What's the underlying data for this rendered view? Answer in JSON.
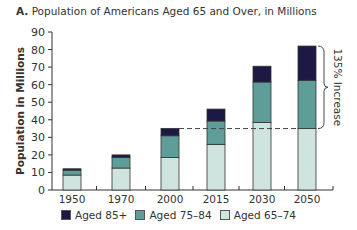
{
  "chart_data": {
    "type": "bar",
    "stacked": true,
    "title_prefix": "A.",
    "title": "Population of Americans Aged 65 and Over, in Millions",
    "xlabel": "",
    "ylabel": "Population in Millions",
    "ylim": [
      0,
      90
    ],
    "yticks": [
      0,
      10,
      20,
      30,
      40,
      50,
      60,
      70,
      80,
      90
    ],
    "categories": [
      "1950",
      "1970",
      "2000",
      "2015",
      "2030",
      "2050"
    ],
    "series": [
      {
        "name": "Aged 65–74",
        "color": "#cfe3df",
        "values": [
          8.5,
          12.5,
          18.5,
          26,
          38.5,
          35
        ]
      },
      {
        "name": "Aged 75–84",
        "color": "#5f9e98",
        "values": [
          2.8,
          6.0,
          12.4,
          13.3,
          23.0,
          27.5
        ]
      },
      {
        "name": "Aged 85+",
        "color": "#1c1a45",
        "values": [
          0.8,
          1.5,
          4.2,
          6.8,
          9.0,
          19.5
        ]
      }
    ],
    "totals": [
      12.1,
      20.0,
      35.1,
      46.1,
      70.5,
      82.0
    ],
    "annotations": [
      {
        "text": "135% Increase",
        "type": "brace",
        "from": 35,
        "to": 82,
        "category": "2050"
      },
      {
        "type": "dashed-line",
        "y": 35,
        "from_category": "2000",
        "to_category": "2050"
      }
    ],
    "grid": false,
    "legend_position": "bottom"
  },
  "legend": {
    "items": [
      {
        "label": "Aged 85+",
        "color": "#1c1a45"
      },
      {
        "label": "Aged 75–84",
        "color": "#5f9e98"
      },
      {
        "label": "Aged 65–74",
        "color": "#cfe3df"
      }
    ]
  }
}
